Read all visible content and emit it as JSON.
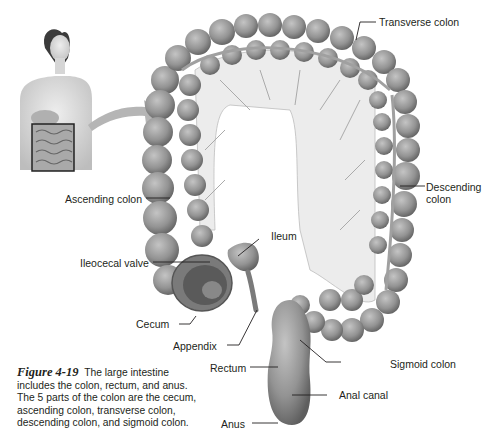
{
  "figure": {
    "number": "Figure 4-19",
    "caption": "The large intestine includes the colon, rectum, and anus. The 5 parts of the colon are the cecum, ascending colon, transverse colon, descending colon, and sigmoid colon."
  },
  "labels": {
    "transverse_colon": "Transverse colon",
    "descending_colon_line1": "Descending",
    "descending_colon_line2": "colon",
    "ascending_colon": "Ascending colon",
    "ileum": "Ileum",
    "ileocecal_valve": "Ileocecal valve",
    "cecum": "Cecum",
    "appendix": "Appendix",
    "rectum": "Rectum",
    "sigmoid_colon": "Sigmoid colon",
    "anal_canal": "Anal canal",
    "anus": "Anus"
  },
  "colors": {
    "colon_fill": "#9a9a9a",
    "colon_shadow": "#6b6b6b",
    "mesentery": "#e8e8e8",
    "arrow": "#b8b8b8",
    "text": "#231f20"
  }
}
